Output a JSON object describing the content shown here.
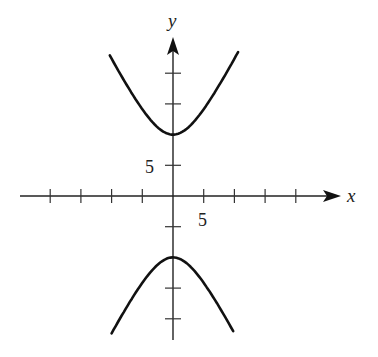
{
  "chart_data": {
    "type": "line",
    "title": "",
    "xlabel": "x",
    "ylabel": "y",
    "equation": "y^2/100 - x^2/25 = 1",
    "tick_spacing": 5,
    "x_ticks": [
      -20,
      -15,
      -10,
      -5,
      5,
      10,
      15,
      20
    ],
    "y_ticks": [
      -20,
      -15,
      -5,
      5,
      15,
      20
    ],
    "tick_labels": {
      "x": "5",
      "y": "5"
    },
    "xlim": [
      -25,
      28
    ],
    "ylim": [
      -26,
      31
    ],
    "grid": false,
    "legend": null,
    "series": [
      {
        "name": "upper branch",
        "x_range": [
          -10.3,
          10.6
        ],
        "vertex": [
          0,
          10
        ]
      },
      {
        "name": "lower branch",
        "x_range": [
          -10.0,
          9.8
        ],
        "vertex": [
          0,
          -10
        ]
      }
    ]
  },
  "axes": {
    "x_label": "x",
    "y_label": "y",
    "x_tick_label": "5",
    "y_tick_label": "5"
  }
}
